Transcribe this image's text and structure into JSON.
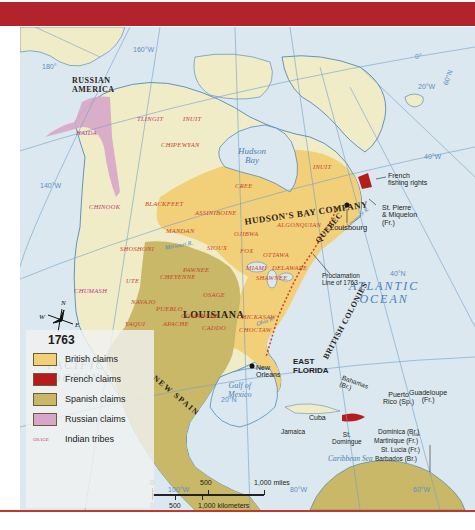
{
  "map": {
    "year": "1763",
    "colors": {
      "british": "#f2d07a",
      "french": "#b71c1c",
      "spanish": "#c9b867",
      "russian": "#d7a6c9",
      "water": "#dbe8ef",
      "unclaimed": "#f1ecc8",
      "frame": "#b3232b"
    },
    "regions": {
      "russian_america": "RUSSIAN\nAMERICA",
      "hudsons_bay": "HUDSON'S BAY COMPANY",
      "quebec": "QUEBEC",
      "louisiana": "LOUISIANA",
      "british_colonies": "BRITISH COLONIES",
      "new_spain": "NEW SPAIN",
      "east_florida": "EAST\nFLORIDA"
    },
    "water": {
      "pacific": "PACIFIC\nOCEAN",
      "atlantic": "ATLANTIC\nOCEAN",
      "hudson_bay": "Hudson\nBay",
      "gulf": "Gulf of\nMexico",
      "caribbean": "Caribbean Sea",
      "missouri": "Missouri R.",
      "mississippi": "Mississippi R.",
      "ohio": "Ohio R.",
      "st_lawrence": "St. Lawrence R.",
      "rio_grande": "Rio Grande"
    },
    "tribes": [
      {
        "name": "TLINGIT",
        "x": 137,
        "y": 116,
        "pink": true
      },
      {
        "name": "HAIDA",
        "x": 76,
        "y": 130,
        "pink": true
      },
      {
        "name": "INUIT",
        "x": 183,
        "y": 116
      },
      {
        "name": "CHIPEWYAN",
        "x": 161,
        "y": 142
      },
      {
        "name": "CHINOOK",
        "x": 89,
        "y": 204,
        "pink": true
      },
      {
        "name": "BLACKFEET",
        "x": 145,
        "y": 201
      },
      {
        "name": "ASSINIBOINE",
        "x": 195,
        "y": 210
      },
      {
        "name": "CREE",
        "x": 235,
        "y": 183
      },
      {
        "name": "INUIT",
        "x": 313,
        "y": 164
      },
      {
        "name": "MANDAN",
        "x": 166,
        "y": 228
      },
      {
        "name": "SHOSHONI",
        "x": 120,
        "y": 246
      },
      {
        "name": "SIOUX",
        "x": 207,
        "y": 245
      },
      {
        "name": "OJIBWA",
        "x": 234,
        "y": 231
      },
      {
        "name": "ALGONQUIAN",
        "x": 277,
        "y": 222
      },
      {
        "name": "FOX",
        "x": 240,
        "y": 248
      },
      {
        "name": "OTTAWA",
        "x": 263,
        "y": 252
      },
      {
        "name": "PAWNEE",
        "x": 183,
        "y": 267
      },
      {
        "name": "MIAMI",
        "x": 246,
        "y": 265
      },
      {
        "name": "DELAWARE",
        "x": 272,
        "y": 265
      },
      {
        "name": "CHEYENNE",
        "x": 160,
        "y": 274
      },
      {
        "name": "SHAWNEE",
        "x": 256,
        "y": 275
      },
      {
        "name": "UTE",
        "x": 126,
        "y": 278
      },
      {
        "name": "OSAGE",
        "x": 203,
        "y": 292
      },
      {
        "name": "CHUMASH",
        "x": 74,
        "y": 288,
        "pink": true
      },
      {
        "name": "NAVAJO",
        "x": 131,
        "y": 299
      },
      {
        "name": "PUEBLO",
        "x": 156,
        "y": 306
      },
      {
        "name": "COMANCHE",
        "x": 181,
        "y": 313
      },
      {
        "name": "APACHE",
        "x": 163,
        "y": 321
      },
      {
        "name": "CADDO",
        "x": 202,
        "y": 325
      },
      {
        "name": "YAQUI",
        "x": 125,
        "y": 321
      },
      {
        "name": "CHICKASAW",
        "x": 237,
        "y": 314
      },
      {
        "name": "CHOCTAW",
        "x": 239,
        "y": 327
      }
    ],
    "places": {
      "french_fishing": "French\nfishing rights",
      "st_pierre": "St. Pierre\n& Miquelon\n(Fr.)",
      "louisbourg": "Louisbourg",
      "proclamation": "Proclamation\nLine of 1763",
      "new_orleans": "New\nOrleans",
      "bahamas": "Bahamas\n(Br.)",
      "cuba": "Cuba",
      "jamaica": "Jamaica",
      "st_domingue": "St.\nDomingue",
      "puerto_rico": "Puerto\nRico (Sp.)",
      "guadeloupe": "Guadeloupe\n(Fr.)",
      "dominica": "Dominica (Br.)",
      "martinique": "Martinique (Fr.)",
      "st_lucia": "St. Lucia (Fr.)",
      "barbados": "Barbados (Br.)"
    },
    "gridlines": {
      "lon_180": "180°",
      "lon_160": "160°W",
      "lon_140": "140°W",
      "lon_120": "120°W",
      "lon_100": "100°W",
      "lon_80": "80°W",
      "lon_60": "60°W",
      "lon_40": "40°W",
      "lon_20": "20°W",
      "lon_0": "0°",
      "lat_60": "60°N",
      "lat_40": "40°N",
      "lat_20": "20°N"
    },
    "compass": {
      "n": "N",
      "s": "S",
      "e": "E",
      "w": "W"
    }
  },
  "legend": {
    "title": "1763",
    "items": [
      {
        "label": "British claims",
        "color": "#f2d07a"
      },
      {
        "label": "French claims",
        "color": "#b71c1c"
      },
      {
        "label": "Spanish claims",
        "color": "#c9b867"
      },
      {
        "label": "Russian claims",
        "color": "#d7a6c9"
      }
    ],
    "tribe_sample": "OSAGE",
    "tribe_label": "Indian tribes"
  },
  "scale": {
    "miles_0": "0",
    "miles_500": "500",
    "miles_1000": "1,000 miles",
    "km_0": "0",
    "km_500": "500",
    "km_1000": "1,000 kilometers"
  }
}
